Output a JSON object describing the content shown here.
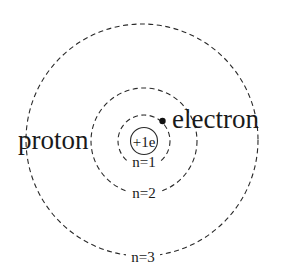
{
  "diagram": {
    "type": "bohr-model-hydrogen-atom",
    "labels": {
      "proton": "proton",
      "electron": "electron",
      "nucleus_charge": "+1e",
      "orbit_1": "n=1",
      "orbit_2": "n=2",
      "orbit_3": "n=3"
    },
    "orbits": [
      {
        "n": 1,
        "label": "n=1",
        "style": "dashed"
      },
      {
        "n": 2,
        "label": "n=2",
        "style": "dashed"
      },
      {
        "n": 3,
        "label": "n=3",
        "style": "dashed"
      }
    ],
    "nucleus": {
      "label": "+1e",
      "style": "solid"
    },
    "electron": {
      "label": "electron",
      "orbit": 1
    },
    "colors": {
      "line": "#2a2a2a",
      "text": "#1a1a1a",
      "background": "#ffffff"
    }
  }
}
